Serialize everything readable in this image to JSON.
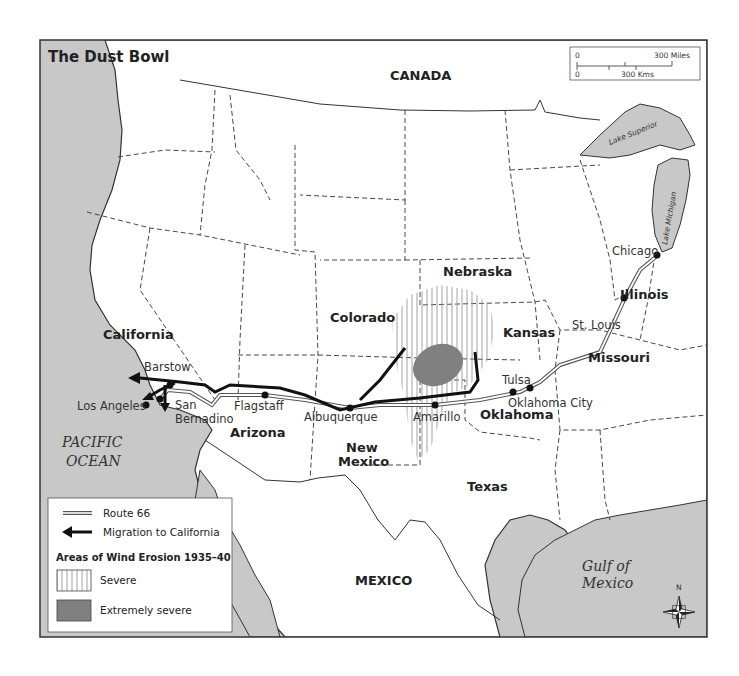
{
  "map": {
    "title": "The Dust Bowl",
    "colors": {
      "water": "#c8c8c8",
      "land": "#ffffff",
      "border": "#333333",
      "erosion_extreme": "#808080",
      "migration": "#111111"
    },
    "scale_bar": {
      "miles_zero": "0",
      "miles_label": "300 Miles",
      "kms_zero": "0",
      "kms_label": "300 Kms"
    },
    "regions": {
      "canada": "CANADA",
      "mexico": "MEXICO",
      "pacific_line1": "PACIFIC",
      "pacific_line2": "OCEAN",
      "gulf_line1": "Gulf of",
      "gulf_line2": "Mexico",
      "lake_superior": "Lake Superior",
      "lake_michigan": "Lake Michigan"
    },
    "states": {
      "california": "California",
      "arizona": "Arizona",
      "colorado": "Colorado",
      "new_mexico_1": "New",
      "new_mexico_2": "Mexico",
      "texas": "Texas",
      "oklahoma": "Oklahoma",
      "kansas": "Kansas",
      "nebraska": "Nebraska",
      "missouri": "Missouri",
      "illinois": "Illinois"
    },
    "cities": {
      "barstow": "Barstow",
      "los_angeles": "Los Angeles",
      "san_bernardino_1": "San",
      "san_bernardino_2": "Bernadino",
      "flagstaff": "Flagstaff",
      "albuquerque": "Albuquerque",
      "amarillo": "Amarillo",
      "tulsa": "Tulsa",
      "oklahoma_city": "Oklahoma City",
      "st_louis": "St. Louis",
      "chicago": "Chicago"
    },
    "compass": {
      "north": "N"
    },
    "legend": {
      "route66": "Route 66",
      "migration": "Migration to California",
      "erosion_heading": "Areas of Wind Erosion 1935–40",
      "severe": "Severe",
      "extremely_severe": "Extremely severe"
    }
  }
}
